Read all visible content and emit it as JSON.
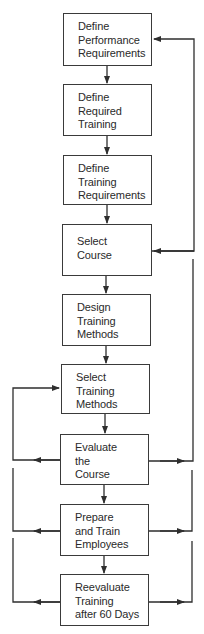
{
  "diagram": {
    "type": "flowchart",
    "colors": {
      "line": "#2e2e2e",
      "box_border": "#3a3a3a",
      "text": "#2a2a2a",
      "background": "#ffffff"
    },
    "steps": [
      {
        "id": "define-performance-requirements",
        "lines": [
          "Define",
          "Performance",
          "Requirements"
        ]
      },
      {
        "id": "define-required-training",
        "lines": [
          "Define",
          "Required",
          "Training"
        ]
      },
      {
        "id": "define-training-requirements",
        "lines": [
          "Define",
          "Training",
          "Requirements"
        ]
      },
      {
        "id": "select-course",
        "lines": [
          "Select",
          "Course"
        ]
      },
      {
        "id": "design-training-methods",
        "lines": [
          "Design",
          "Training",
          "Methods"
        ]
      },
      {
        "id": "select-training-methods",
        "lines": [
          "Select",
          "Training",
          "Methods"
        ]
      },
      {
        "id": "evaluate-the-course",
        "lines": [
          "Evaluate",
          "the",
          "Course"
        ]
      },
      {
        "id": "prepare-and-train-employees",
        "lines": [
          "Prepare",
          "and Train",
          "Employees"
        ]
      },
      {
        "id": "reevaluate-training",
        "lines": [
          "Reevaluate",
          "Training",
          "after 60 Days"
        ]
      }
    ],
    "feedback_loops": [
      {
        "side": "right",
        "from": "select-course",
        "to": "define-performance-requirements"
      },
      {
        "side": "right",
        "from": "evaluate-the-course",
        "to": "select-course"
      },
      {
        "side": "right",
        "from": "prepare-and-train-employees",
        "to": "evaluate-the-course"
      },
      {
        "side": "right",
        "from": "reevaluate-training",
        "to": "prepare-and-train-employees"
      },
      {
        "side": "left",
        "from": "evaluate-the-course",
        "to": "select-training-methods"
      },
      {
        "side": "left",
        "from": "prepare-and-train-employees",
        "to": "evaluate-the-course"
      },
      {
        "side": "left",
        "from": "reevaluate-training",
        "to": "prepare-and-train-employees"
      }
    ]
  }
}
